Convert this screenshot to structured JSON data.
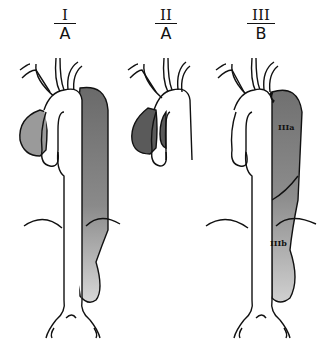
{
  "diagram": {
    "panels": [
      {
        "id": "I",
        "numeral": "I",
        "letter": "A",
        "sublabels": []
      },
      {
        "id": "II",
        "numeral": "II",
        "letter": "A",
        "sublabels": []
      },
      {
        "id": "III",
        "numeral": "III",
        "letter": "B",
        "sublabels": [
          "IIIa",
          "IIIb"
        ]
      }
    ],
    "colors": {
      "outline": "#111111",
      "dissection_dark": "#6e6e6e",
      "dissection_light": "#cfcfcf",
      "background": "#ffffff"
    }
  }
}
